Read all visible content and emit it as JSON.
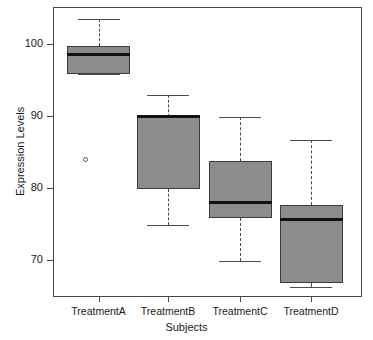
{
  "chart_data": {
    "type": "box",
    "title": "",
    "xlabel": "Subjects",
    "ylabel": "Expression Levels",
    "categories": [
      "TreatmentA",
      "TreatmentB",
      "TreatmentC",
      "TreatmentD"
    ],
    "ylim": [
      65.5,
      104.8
    ],
    "yticks": [
      70,
      80,
      90,
      100
    ],
    "ytick_labels": [
      "70",
      "80",
      "90",
      "100"
    ],
    "grid": false,
    "legend": null,
    "box_fill_color": "#8c8c8c",
    "box_edge_color": "#3c3c3c",
    "median_color": "#111111",
    "whisker_color": "#4a4a4a",
    "boxes": [
      {
        "name": "TreatmentA",
        "whisker_low": 95.8,
        "q1": 95.8,
        "median": 98.6,
        "q3": 99.7,
        "whisker_high": 103.5,
        "outliers": [
          83.9
        ]
      },
      {
        "name": "TreatmentB",
        "whisker_low": 74.9,
        "q1": 79.9,
        "median": 89.9,
        "q3": 89.9,
        "whisker_high": 92.9,
        "outliers": []
      },
      {
        "name": "TreatmentC",
        "whisker_low": 69.8,
        "q1": 75.8,
        "median": 78.0,
        "q3": 83.8,
        "whisker_high": 89.8,
        "outliers": []
      },
      {
        "name": "TreatmentD",
        "whisker_low": 66.3,
        "q1": 66.8,
        "median": 75.6,
        "q3": 77.6,
        "whisker_high": 86.7,
        "outliers": []
      }
    ]
  }
}
